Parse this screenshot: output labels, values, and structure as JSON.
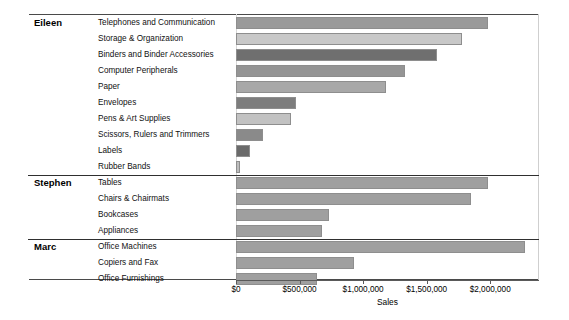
{
  "chart_data": {
    "type": "bar",
    "orientation": "horizontal",
    "title": "",
    "xlabel": "Sales",
    "ylabel": "",
    "xlim": [
      0,
      2250000
    ],
    "grid": false,
    "legend": null,
    "axis_ticks": [
      {
        "value": 0,
        "label": "$0"
      },
      {
        "value": 500000,
        "label": "$500,000"
      },
      {
        "value": 1000000,
        "label": "$1,000,000"
      },
      {
        "value": 1500000,
        "label": "$1,500,000"
      },
      {
        "value": 2000000,
        "label": "$2,000,000"
      }
    ],
    "groups": [
      {
        "name": "Eileen",
        "categories": [
          "Telephones and Communication",
          "Storage & Organization",
          "Binders and Binder Accessories",
          "Computer Peripherals",
          "Paper",
          "Envelopes",
          "Pens & Art Supplies",
          "Scissors, Rulers and Trimmers",
          "Labels",
          "Rubber Bands"
        ],
        "values": [
          1985000,
          1780000,
          1580000,
          1330000,
          1180000,
          470000,
          430000,
          210000,
          110000,
          30000
        ],
        "shades": [
          "#9a9a9a",
          "#c8c8c8",
          "#6f6f6f",
          "#959595",
          "#a8a8a8",
          "#7d7d7d",
          "#c2c2c2",
          "#8a8a8a",
          "#6a6a6a",
          "#bdbdbd"
        ]
      },
      {
        "name": "Stephen",
        "categories": [
          "Tables",
          "Chairs & Chairmats",
          "Bookcases",
          "Appliances"
        ],
        "values": [
          1985000,
          1845000,
          735000,
          680000
        ],
        "shades": [
          "#9f9f9f",
          "#9f9f9f",
          "#9f9f9f",
          "#9f9f9f"
        ]
      },
      {
        "name": "Marc",
        "categories": [
          "Office Machines",
          "Copiers and Fax",
          "Office Furnishings"
        ],
        "values": [
          2275000,
          925000,
          640000
        ],
        "shades": [
          "#9f9f9f",
          "#9f9f9f",
          "#9f9f9f"
        ]
      }
    ]
  },
  "axis": {
    "title": "Sales",
    "tick_labels": [
      "$0",
      "$500,000",
      "$1,000,000",
      "$1,500,000",
      "$2,000,000"
    ]
  },
  "colors": {
    "frame": "#4a4a4a",
    "bar_border": "#8e8e8e",
    "bar_default": "#9f9f9f",
    "background": "#ffffff"
  }
}
